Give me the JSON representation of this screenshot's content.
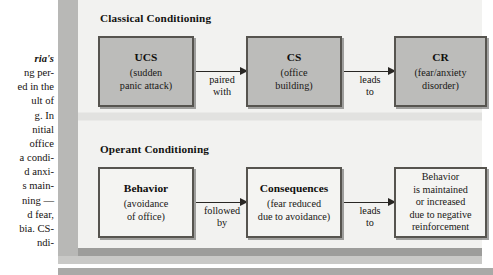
{
  "body_text": {
    "lines": [
      {
        "text": "ria's",
        "italic": true
      },
      {
        "text": "ng per-",
        "italic": false
      },
      {
        "text": "ed in the",
        "italic": false
      },
      {
        "text": "ult of",
        "italic": false
      },
      {
        "text": "g. In",
        "italic": false
      },
      {
        "text": "nitial",
        "italic": false
      },
      {
        "text": "office",
        "italic": false
      },
      {
        "text": "a condi-",
        "italic": false
      },
      {
        "text": "d anxi-",
        "italic": false
      },
      {
        "text": "s main-",
        "italic": false
      },
      {
        "text": "ning —",
        "italic": false
      },
      {
        "text": "d fear,",
        "italic": false
      },
      {
        "text": "bia. CS-",
        "italic": false
      },
      {
        "text": "ndi-",
        "italic": false
      }
    ]
  },
  "figure": {
    "sections": [
      {
        "heading": "Classical Conditioning",
        "style": "classical",
        "boxes": [
          {
            "title": "UCS",
            "sub_line_1": "(sudden",
            "sub_line_2": "panic attack)"
          },
          {
            "title": "CS",
            "sub_line_1": "(office",
            "sub_line_2": "building)"
          },
          {
            "title": "CR",
            "sub_line_1": "(fear/anxiety",
            "sub_line_2": "disorder)"
          }
        ],
        "arrow_labels": [
          {
            "line_1": "paired",
            "line_2": "with"
          },
          {
            "line_1": "leads",
            "line_2": "to"
          }
        ]
      },
      {
        "heading": "Operant Conditioning",
        "style": "operant",
        "boxes": [
          {
            "title": "Behavior",
            "sub_line_1": "(avoidance",
            "sub_line_2": "of office)"
          },
          {
            "title": "Consequences",
            "sub_line_1": "(fear reduced",
            "sub_line_2": "due to avoidance)"
          },
          {
            "title": "",
            "sub_line_1": "Behavior",
            "sub_line_2": "is maintained",
            "sub_line_3": "or increased",
            "sub_line_4": "due to negative",
            "sub_line_5": "reinforcement"
          }
        ],
        "arrow_labels": [
          {
            "line_1": "followed",
            "line_2": "by"
          },
          {
            "line_1": "leads",
            "line_2": "to"
          }
        ]
      }
    ],
    "colors": {
      "classical_box_fill": "#bcbcba",
      "operant_box_fill": "#f4f4f2",
      "box_border": "#56544f",
      "panel_background": "#d8d8d6",
      "panel_inner": "#f2f2f0",
      "arrow": "#292724"
    }
  }
}
